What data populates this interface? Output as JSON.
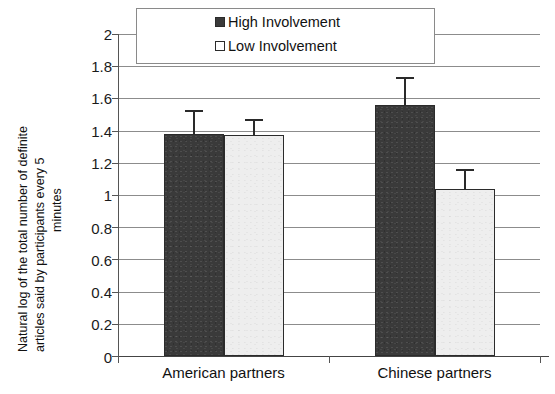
{
  "chart_data": {
    "type": "bar",
    "title": "",
    "subtitle": "",
    "xlabel": "",
    "ylabel": "Natural log of the total number of definite articles said by participants every 5 minutes",
    "ylabel_lines": [
      "Natural log of the total number of definite",
      "articles said by participants every 5",
      "minutes"
    ],
    "categories": [
      "American partners",
      "Chinese partners"
    ],
    "series": [
      {
        "name": "High Involvement",
        "color": "#3a3a3a",
        "values": [
          1.38,
          1.56
        ],
        "errors": [
          0.15,
          0.17
        ]
      },
      {
        "name": "Low Involvement",
        "color": "#eeeeee",
        "values": [
          1.37,
          1.04
        ],
        "errors": [
          0.1,
          0.12
        ]
      }
    ],
    "ylim": [
      0,
      2
    ],
    "ytick_values": [
      2,
      1.8,
      1.6,
      1.4,
      1.2,
      1,
      0.8,
      0.6,
      0.4,
      0.2,
      0
    ],
    "ytick_labels": [
      "2",
      "1.8",
      "1.6",
      "1.4",
      "1.2",
      "1",
      "0.8",
      "0.6",
      "0.4",
      "0.2",
      "0"
    ],
    "grid": true,
    "grid_axis": "y",
    "legend_position": "top-center",
    "legend_entries": [
      "High Involvement",
      "Low Involvement"
    ],
    "error_bar_style": "upper-only"
  },
  "legend": {
    "entries": [
      {
        "label": "High Involvement",
        "marker": "filled-square-marker"
      },
      {
        "label": "Low Involvement",
        "marker": "empty-square-marker"
      }
    ]
  },
  "axes": {
    "y": {
      "ticks": [
        "2",
        "1.8",
        "1.6",
        "1.4",
        "1.2",
        "1",
        "0.8",
        "0.6",
        "0.4",
        "0.2",
        "0"
      ],
      "title_lines": [
        "Natural log of the total number of definite",
        "articles said by participants every 5",
        "minutes"
      ]
    },
    "x": {
      "categories": [
        "American partners",
        "Chinese partners"
      ]
    }
  },
  "colors": {
    "high_involvement": "#3a3a3a",
    "low_involvement": "#eeeeee",
    "gridline": "#8c8c8c",
    "axis": "#444444",
    "text": "#111111",
    "background": "#ffffff"
  }
}
